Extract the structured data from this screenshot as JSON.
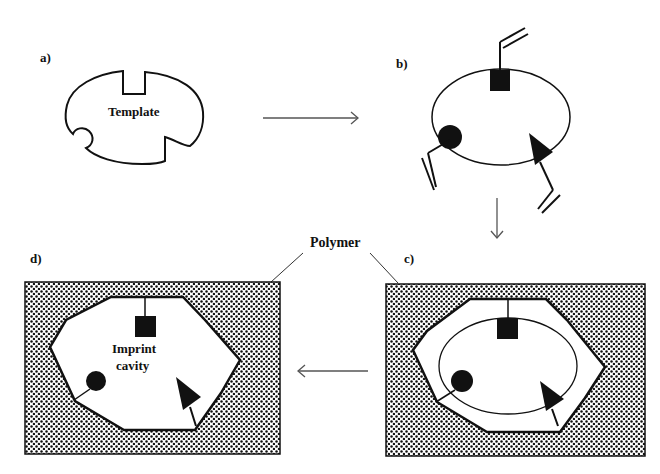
{
  "figure": {
    "panels": {
      "a": {
        "label": "a)",
        "text": "Template"
      },
      "b": {
        "label": "b)"
      },
      "c": {
        "label": "c)"
      },
      "d": {
        "label": "d)",
        "text_line1": "Imprint",
        "text_line2": "cavity"
      }
    },
    "callout": {
      "text": "Polymer"
    },
    "arrows": [
      {
        "from": "a",
        "to": "b",
        "direction": "right"
      },
      {
        "from": "b",
        "to": "c",
        "direction": "down"
      },
      {
        "from": "c",
        "to": "d",
        "direction": "left"
      }
    ],
    "colors": {
      "ink": "#111111",
      "background": "#ffffff",
      "polymer_dots": "#111111"
    }
  }
}
